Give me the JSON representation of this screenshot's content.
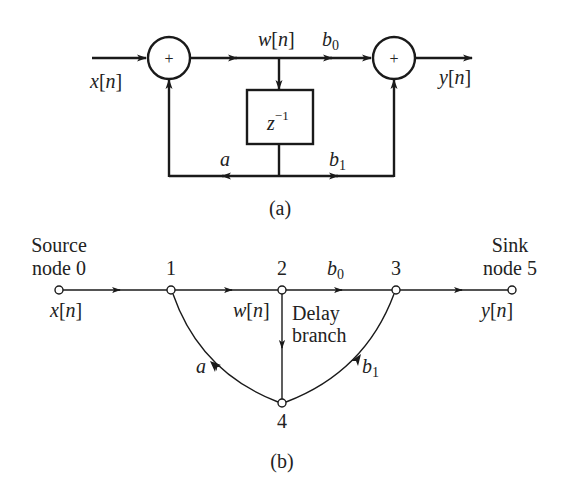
{
  "diagram_a": {
    "caption": "(a)",
    "input_label": {
      "var": "x",
      "idx": "n"
    },
    "output_label": {
      "var": "y",
      "idx": "n"
    },
    "node_label": {
      "var": "w",
      "idx": "n"
    },
    "adder_symbol": "+",
    "delay_block": {
      "base": "z",
      "exp": "−1"
    },
    "coefficients": {
      "b0": {
        "base": "b",
        "sub": "0"
      },
      "b1": {
        "base": "b",
        "sub": "1"
      },
      "a": "a"
    }
  },
  "diagram_b": {
    "caption": "(b)",
    "source": {
      "line1": "Source",
      "line2": "node 0"
    },
    "sink": {
      "line1": "Sink",
      "line2": "node 5"
    },
    "nodes": [
      "1",
      "2",
      "3",
      "4"
    ],
    "input_label": {
      "var": "x",
      "idx": "n"
    },
    "output_label": {
      "var": "y",
      "idx": "n"
    },
    "node_label": {
      "var": "w",
      "idx": "n"
    },
    "delay_branch": {
      "line1": "Delay",
      "line2": "branch"
    },
    "coefficients": {
      "b0": {
        "base": "b",
        "sub": "0"
      },
      "b1": {
        "base": "b",
        "sub": "1"
      },
      "a": "a"
    }
  },
  "colors": {
    "stroke": "#1a1a1a",
    "text": "#222222",
    "background": "#ffffff"
  }
}
